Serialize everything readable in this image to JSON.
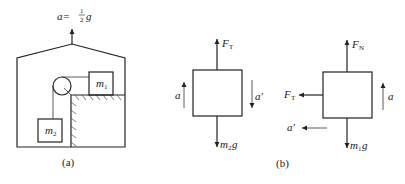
{
  "panel_a": {
    "caption": "(a)",
    "acceleration_label": {
      "prefix": "a=",
      "fraction_num": "1",
      "fraction_den": "2",
      "suffix": "g"
    },
    "block_top": {
      "symbol": "m",
      "subscript": "1"
    },
    "block_hanging": {
      "symbol": "m",
      "subscript": "2"
    }
  },
  "panel_b": {
    "caption": "(b)",
    "fbd_m2": {
      "up_force": {
        "symbol": "F",
        "subscript": "T"
      },
      "down_force": {
        "symbol": "m",
        "subscript": "2",
        "suffix": "g"
      },
      "left_accel": "a",
      "right_accel": "a′"
    },
    "fbd_m1": {
      "up_force": {
        "symbol": "F",
        "subscript": "N"
      },
      "left_force": {
        "symbol": "F",
        "subscript": "T"
      },
      "down_force": {
        "symbol": "m",
        "subscript": "1",
        "suffix": "g"
      },
      "right_accel": "a",
      "bottom_accel": "a′"
    }
  }
}
